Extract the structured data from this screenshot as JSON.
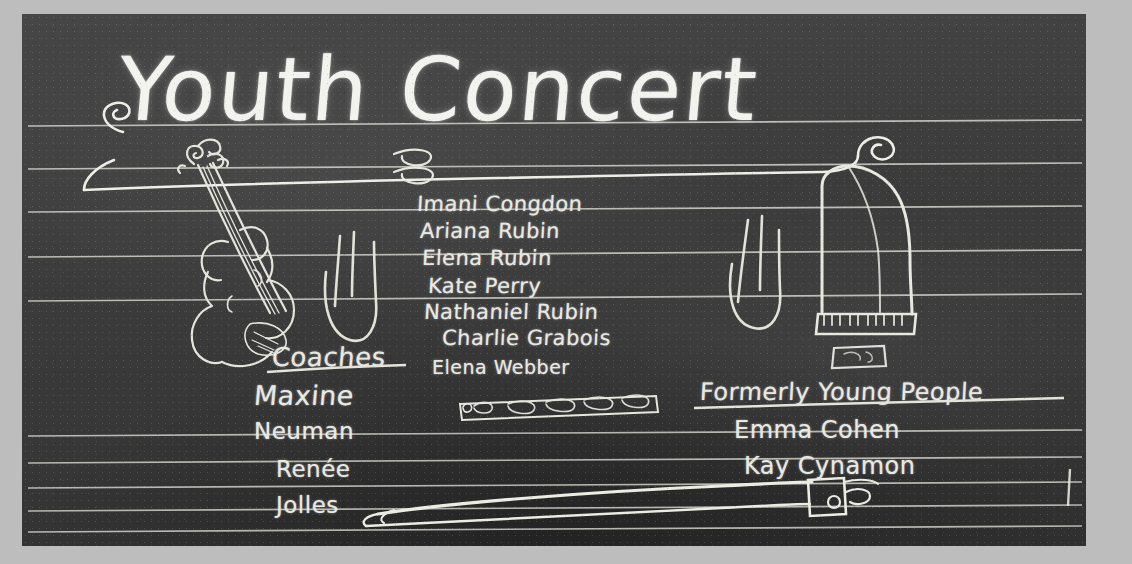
{
  "board": {
    "title": "Youth Concert",
    "frame_color": "#bdbdbd",
    "slate_color": "#3a3a3a",
    "chalk_color": "#e9e9e4",
    "performers": [
      "Imani Congdon",
      "Ariana Rubin",
      "Elena Rubin",
      "Kate Perry",
      "Nathaniel Rubin",
      "Charlie Grabois",
      "Elena Webber"
    ],
    "coaches": {
      "heading": "Coaches",
      "names": [
        "Maxine",
        "Neuman",
        "Renée",
        "Jolles"
      ]
    },
    "formerly_young_people": {
      "heading": "Formerly Young People",
      "names": [
        "Emma Cohen",
        "Kay Cynamon"
      ]
    },
    "drawings": [
      "violin",
      "grand-piano",
      "piano-bench",
      "flute",
      "violin-bow",
      "eighth-note-strokes-left",
      "eighth-note-strokes-right",
      "title-swirl-left",
      "title-swirl-right"
    ],
    "staff_upper_lines": 5,
    "staff_lower_lines": 5
  }
}
